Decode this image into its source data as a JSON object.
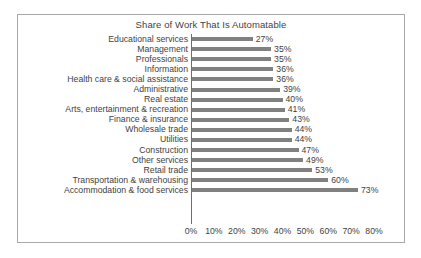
{
  "chart_data": {
    "type": "bar",
    "orientation": "horizontal",
    "title": "Share of Work That Is Automatable",
    "xlabel": "",
    "ylabel": "",
    "xlim": [
      0,
      80
    ],
    "grid": false,
    "legend": null,
    "tick_labels": [
      "0%",
      "10%",
      "20%",
      "30%",
      "40%",
      "50%",
      "60%",
      "70%",
      "80%"
    ],
    "tick_values": [
      0,
      10,
      20,
      30,
      40,
      50,
      60,
      70,
      80
    ],
    "bar_color": "#808080",
    "categories": [
      "Educational services",
      "Management",
      "Professionals",
      "Information",
      "Health care & social assistance",
      "Administrative",
      "Real estate",
      "Arts, entertainment & recreation",
      "Finance & insurance",
      "Wholesale trade",
      "Utilities",
      "Construction",
      "Other services",
      "Retail trade",
      "Transportation & warehousing",
      "Accommodation & food services"
    ],
    "values": [
      27,
      35,
      35,
      36,
      36,
      39,
      40,
      41,
      43,
      44,
      44,
      47,
      49,
      53,
      60,
      73
    ],
    "value_labels": [
      "27%",
      "35%",
      "35%",
      "36%",
      "36%",
      "39%",
      "40%",
      "41%",
      "43%",
      "44%",
      "44%",
      "47%",
      "49%",
      "53%",
      "60%",
      "73%"
    ]
  }
}
